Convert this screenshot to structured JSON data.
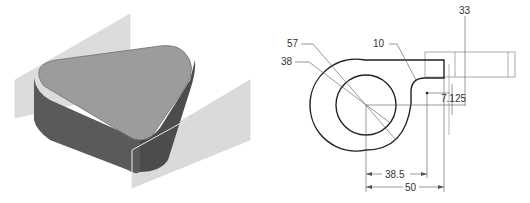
{
  "figure": {
    "left_view": {
      "description": "3D shaded model of a rounded triangular prism with two intersecting planes",
      "colors": {
        "top_face": "#9a9a9a",
        "side_face": "#5e5e5e",
        "side_face_dark": "#4a4a4a",
        "plane": "#d9d9d9"
      }
    },
    "right_view": {
      "description": "2D sketch with dimensions: outer arc, inner circle, tab, fillet",
      "dimensions": {
        "outer_diameter": "57",
        "inner_diameter": "38",
        "fillet_radius": "10",
        "top_offset": "33",
        "tab_offset": "7.125",
        "inner_horizontal": "38.5",
        "outer_horizontal": "50"
      },
      "colors": {
        "profile": "#222222",
        "dimension_line": "#555555",
        "reference_geometry": "#888888"
      }
    }
  }
}
